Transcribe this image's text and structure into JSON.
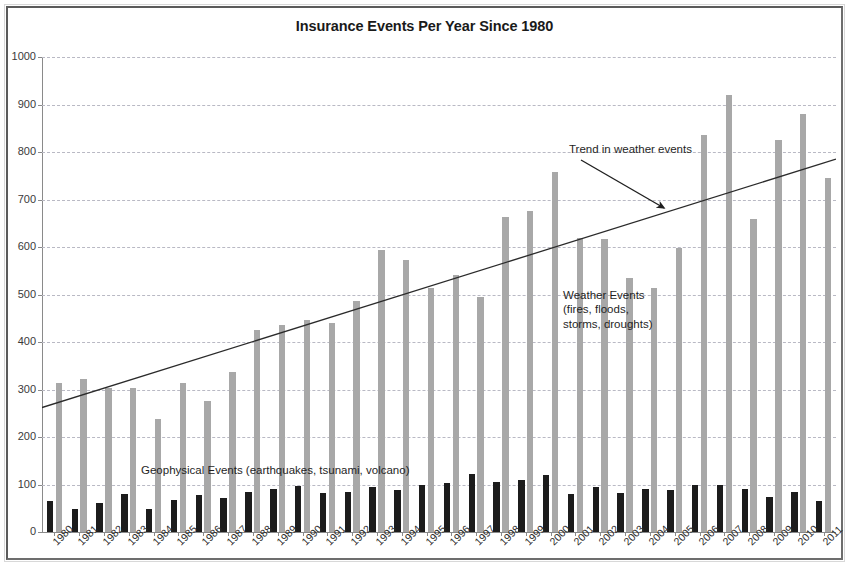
{
  "chart_data": {
    "type": "bar",
    "title": "Insurance Events Per Year Since 1980",
    "xlabel": "",
    "ylabel": "",
    "ylim": [
      0,
      1000
    ],
    "ytick_step": 100,
    "yticks": [
      0,
      100,
      200,
      300,
      400,
      500,
      600,
      700,
      800,
      900,
      1000
    ],
    "grid": true,
    "legend_position": "inline-annotations",
    "categories": [
      "1980",
      "1981",
      "1982",
      "1983",
      "1984",
      "1985",
      "1986",
      "1987",
      "1988",
      "1989",
      "1990",
      "1991",
      "1992",
      "1993",
      "1994",
      "1995",
      "1996",
      "1997",
      "1998",
      "1999",
      "2000",
      "2001",
      "2002",
      "2003",
      "2004",
      "2005",
      "2006",
      "2007",
      "2008",
      "2009",
      "2010",
      "2011"
    ],
    "series": [
      {
        "name": "Geophysical Events (earthquakes, tsunami, volcano)",
        "color": "#1c1c1c",
        "values": [
          65,
          48,
          62,
          80,
          48,
          68,
          77,
          72,
          85,
          90,
          97,
          82,
          85,
          95,
          88,
          100,
          103,
          122,
          105,
          110,
          120,
          80,
          95,
          83,
          90,
          88,
          100,
          98,
          90,
          73,
          85,
          65
        ]
      },
      {
        "name": "Weather Events (fires, floods, storms, droughts)",
        "color": "#a8a8a8",
        "values": [
          313,
          322,
          303,
          303,
          238,
          313,
          275,
          337,
          425,
          435,
          447,
          440,
          487,
          593,
          573,
          513,
          542,
          495,
          663,
          675,
          757,
          620,
          617,
          535,
          513,
          597,
          835,
          920,
          660,
          825,
          880,
          745
        ]
      }
    ],
    "annotations": [
      {
        "id": "trend",
        "text": "Trend in weather events"
      },
      {
        "id": "weather",
        "text": "Weather Events\n(fires, floods,\nstorms, droughts)"
      },
      {
        "id": "geophysical",
        "text": "Geophysical Events (earthquakes, tsunami, volcano)"
      }
    ],
    "trendline": {
      "y_start": 262,
      "y_end": 785,
      "color": "#2b2b2b"
    }
  },
  "colors": {
    "geophysical_bar": "#1c1c1c",
    "weather_bar": "#a8a8a8",
    "gridline": "#b9b9c4",
    "axis": "#8a8a8a",
    "frame": "#5b5b5b",
    "text": "#1a1a1a"
  }
}
